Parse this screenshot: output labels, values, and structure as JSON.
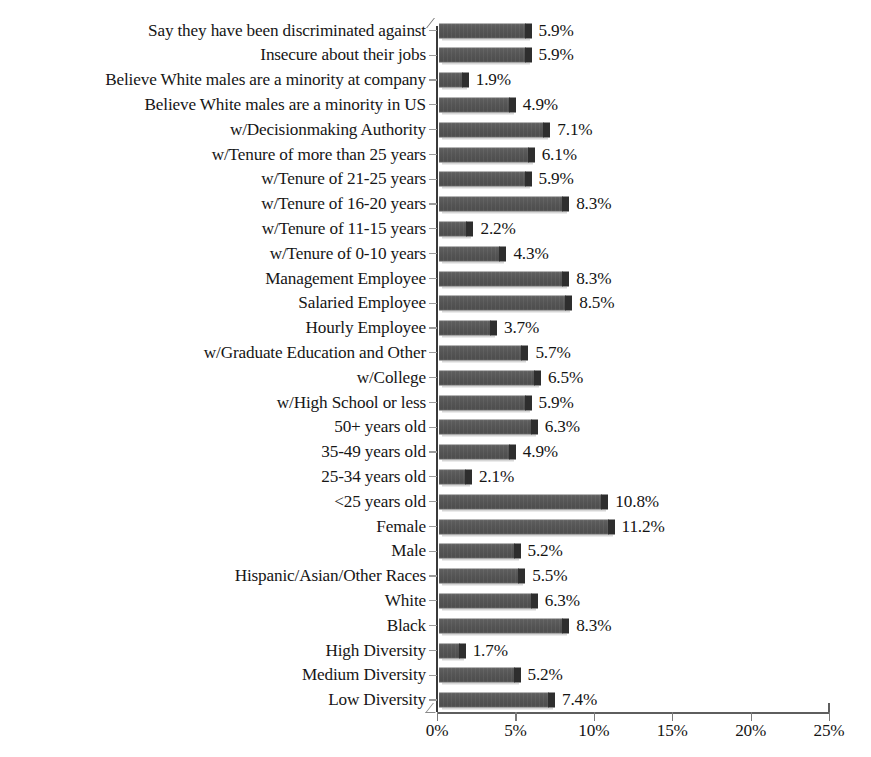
{
  "chart_data": {
    "type": "bar",
    "orientation": "horizontal",
    "title": "",
    "subtitle": "",
    "xlabel": "",
    "ylabel": "",
    "xlim": [
      0,
      25
    ],
    "xunit": "%",
    "grid": false,
    "legend": null,
    "xticks": [
      "0%",
      "5%",
      "10%",
      "15%",
      "20%",
      "25%"
    ],
    "xtick_values": [
      0,
      5,
      10,
      15,
      20,
      25
    ],
    "categories": [
      "Say they have been discriminated against",
      "Insecure about their jobs",
      "Believe White males are a minority at company",
      "Believe White males are a minority in US",
      "w/Decisionmaking Authority",
      "w/Tenure of more than 25 years",
      "w/Tenure of 21-25 years",
      "w/Tenure of 16-20 years",
      "w/Tenure of 11-15 years",
      "w/Tenure of 0-10 years",
      "Management Employee",
      "Salaried Employee",
      "Hourly Employee",
      "w/Graduate Education and Other",
      "w/College",
      "w/High School or less",
      "50+ years old",
      "35-49 years old",
      "25-34 years old",
      "<25 years old",
      "Female",
      "Male",
      "Hispanic/Asian/Other Races",
      "White",
      "Black",
      "High Diversity",
      "Medium Diversity",
      "Low Diversity"
    ],
    "values": [
      5.9,
      5.9,
      1.9,
      4.9,
      7.1,
      6.1,
      5.9,
      8.3,
      2.2,
      4.3,
      8.3,
      8.5,
      3.7,
      5.7,
      6.5,
      5.9,
      6.3,
      4.9,
      2.1,
      10.8,
      11.2,
      5.2,
      5.5,
      6.3,
      8.3,
      1.7,
      5.2,
      7.4
    ],
    "value_labels": [
      "5.9%",
      "5.9%",
      "1.9%",
      "4.9%",
      "7.1%",
      "6.1%",
      "5.9%",
      "8.3%",
      "2.2%",
      "4.3%",
      "8.3%",
      "8.5%",
      "3.7%",
      "5.7%",
      "6.5%",
      "5.9%",
      "6.3%",
      "4.9%",
      "2.1%",
      "10.8%",
      "11.2%",
      "5.2%",
      "5.5%",
      "6.3%",
      "8.3%",
      "1.7%",
      "5.2%",
      "7.4%"
    ],
    "colors": {
      "bar_face": "#545454",
      "bar_cap": "#2e2e2e",
      "axis": "#5e5e5e",
      "text": "#141414",
      "background": "#ffffff"
    }
  }
}
